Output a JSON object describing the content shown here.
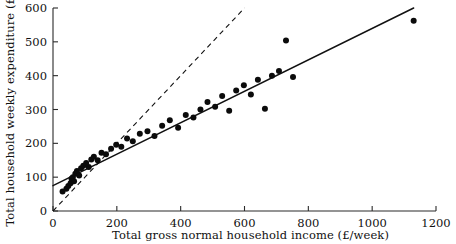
{
  "chart_data": {
    "type": "scatter",
    "title": "",
    "xlabel": "Total gross normal household income (£/week)",
    "ylabel": "Total household weekly expenditure  (£)",
    "xlim": [
      0,
      1200
    ],
    "ylim": [
      0,
      600
    ],
    "xticks": [
      0,
      200,
      400,
      600,
      800,
      1000,
      1200
    ],
    "yticks": [
      0,
      100,
      200,
      300,
      400,
      500,
      600
    ],
    "xtick_labels": [
      "0",
      "200",
      "400",
      "600",
      "800",
      "1000",
      "1200"
    ],
    "ytick_labels": [
      "0",
      "100",
      "200",
      "300",
      "400",
      "500",
      "600"
    ],
    "grid": false,
    "legend": "none",
    "point_color": "#0b0b0b",
    "point_radius": 3.0,
    "series": [
      {
        "name": "Households",
        "marker": "filled-circle",
        "x": [
          30,
          42,
          48,
          55,
          58,
          62,
          66,
          70,
          75,
          82,
          88,
          95,
          104,
          112,
          120,
          128,
          140,
          152,
          166,
          182,
          198,
          214,
          232,
          250,
          272,
          296,
          318,
          342,
          366,
          392,
          416,
          440,
          462,
          484,
          508,
          530,
          552,
          574,
          598,
          620,
          642,
          664,
          686,
          708,
          730,
          752,
          1130
        ],
        "y": [
          58,
          66,
          74,
          82,
          95,
          100,
          88,
          110,
          118,
          105,
          126,
          134,
          142,
          130,
          152,
          160,
          150,
          172,
          168,
          184,
          196,
          190,
          214,
          206,
          228,
          236,
          222,
          252,
          268,
          246,
          284,
          276,
          300,
          322,
          308,
          340,
          296,
          356,
          372,
          344,
          388,
          302,
          400,
          414,
          504,
          396,
          562
        ]
      }
    ],
    "lines": [
      {
        "name": "regression-line",
        "style": "solid",
        "x_start": 0,
        "y_start": 75,
        "x_end": 1130,
        "y_end": 600,
        "slope": 0.4646,
        "intercept": 75
      },
      {
        "name": "equality-line",
        "style": "dashed",
        "x_start": 0,
        "y_start": 0,
        "x_end": 600,
        "y_end": 600,
        "slope": 1.0,
        "intercept": 0
      }
    ]
  }
}
